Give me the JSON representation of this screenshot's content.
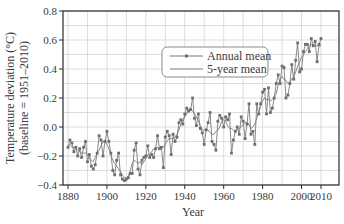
{
  "chart_data": {
    "type": "line",
    "title": "",
    "xlabel": "Year",
    "ylabel": "Temperature deviation (°C)",
    "ylabel_sub": "(baseline = 1951–2010)",
    "xlim": [
      1877,
      2019
    ],
    "ylim": [
      -0.4,
      0.8
    ],
    "grid": true,
    "legend_position": "upper center-right",
    "x_ticks": [
      1880,
      1900,
      1920,
      1940,
      1960,
      1980,
      2000,
      2010
    ],
    "y_ticks": [
      -0.4,
      -0.2,
      0.0,
      0.2,
      0.4,
      0.6,
      0.8
    ],
    "y_tick_labels": [
      "−0.4",
      "−0.2",
      "0.0",
      "0.2",
      "0.4",
      "0.6",
      "0.8"
    ],
    "x": [
      1880,
      1881,
      1882,
      1883,
      1884,
      1885,
      1886,
      1887,
      1888,
      1889,
      1890,
      1891,
      1892,
      1893,
      1894,
      1895,
      1896,
      1897,
      1898,
      1899,
      1900,
      1901,
      1902,
      1903,
      1904,
      1905,
      1906,
      1907,
      1908,
      1909,
      1910,
      1911,
      1912,
      1913,
      1914,
      1915,
      1916,
      1917,
      1918,
      1919,
      1920,
      1921,
      1922,
      1923,
      1924,
      1925,
      1926,
      1927,
      1928,
      1929,
      1930,
      1931,
      1932,
      1933,
      1934,
      1935,
      1936,
      1937,
      1938,
      1939,
      1940,
      1941,
      1942,
      1943,
      1944,
      1945,
      1946,
      1947,
      1948,
      1949,
      1950,
      1951,
      1952,
      1953,
      1954,
      1955,
      1956,
      1957,
      1958,
      1959,
      1960,
      1961,
      1962,
      1963,
      1964,
      1965,
      1966,
      1967,
      1968,
      1969,
      1970,
      1971,
      1972,
      1973,
      1974,
      1975,
      1976,
      1977,
      1978,
      1979,
      1980,
      1981,
      1982,
      1983,
      1984,
      1985,
      1986,
      1987,
      1988,
      1989,
      1990,
      1991,
      1992,
      1993,
      1994,
      1995,
      1996,
      1997,
      1998,
      1999,
      2000,
      2001,
      2002,
      2003,
      2004,
      2005,
      2006,
      2007,
      2008,
      2009,
      2010
    ],
    "series": [
      {
        "name": "Annual mean",
        "marker": "square",
        "values": [
          -0.14,
          -0.09,
          -0.11,
          -0.17,
          -0.14,
          -0.2,
          -0.15,
          -0.21,
          -0.14,
          -0.1,
          -0.24,
          -0.19,
          -0.27,
          -0.29,
          -0.26,
          -0.18,
          -0.06,
          -0.09,
          -0.2,
          -0.1,
          -0.03,
          -0.1,
          -0.18,
          -0.3,
          -0.33,
          -0.23,
          -0.18,
          -0.33,
          -0.36,
          -0.37,
          -0.36,
          -0.35,
          -0.32,
          -0.32,
          -0.16,
          -0.11,
          -0.29,
          -0.33,
          -0.23,
          -0.21,
          -0.2,
          -0.13,
          -0.21,
          -0.19,
          -0.21,
          -0.15,
          -0.06,
          -0.15,
          -0.14,
          -0.28,
          -0.07,
          -0.03,
          -0.06,
          -0.19,
          -0.05,
          -0.1,
          -0.07,
          0.03,
          0.05,
          0.02,
          0.09,
          0.13,
          0.11,
          0.12,
          0.2,
          0.06,
          0.01,
          0.09,
          -0.01,
          -0.04,
          -0.12,
          -0.02,
          0.03,
          0.1,
          -0.1,
          -0.12,
          -0.16,
          0.04,
          0.08,
          0.06,
          0.0,
          0.07,
          0.05,
          0.09,
          -0.18,
          -0.09,
          -0.03,
          0.0,
          -0.05,
          0.07,
          0.04,
          -0.08,
          0.02,
          0.16,
          -0.05,
          -0.03,
          -0.12,
          0.16,
          0.09,
          0.16,
          0.24,
          0.26,
          0.09,
          0.27,
          0.1,
          0.13,
          0.2,
          0.3,
          0.36,
          0.3,
          0.42,
          0.41,
          0.2,
          0.22,
          0.3,
          0.43,
          0.33,
          0.46,
          0.58,
          0.38,
          0.4,
          0.52,
          0.57,
          0.57,
          0.52,
          0.61,
          0.56,
          0.59,
          0.45,
          0.57,
          0.61
        ]
      },
      {
        "name": "5-year mean",
        "marker": "none",
        "values": [
          -0.13,
          -0.12,
          -0.14,
          -0.14,
          -0.15,
          -0.16,
          -0.17,
          -0.18,
          -0.18,
          -0.18,
          -0.19,
          -0.21,
          -0.23,
          -0.24,
          -0.21,
          -0.18,
          -0.16,
          -0.13,
          -0.1,
          -0.1,
          -0.12,
          -0.15,
          -0.19,
          -0.23,
          -0.25,
          -0.27,
          -0.29,
          -0.31,
          -0.33,
          -0.35,
          -0.35,
          -0.34,
          -0.3,
          -0.25,
          -0.23,
          -0.24,
          -0.25,
          -0.24,
          -0.26,
          -0.24,
          -0.22,
          -0.19,
          -0.19,
          -0.17,
          -0.15,
          -0.15,
          -0.14,
          -0.15,
          -0.14,
          -0.14,
          -0.12,
          -0.09,
          -0.08,
          -0.08,
          -0.08,
          -0.07,
          -0.05,
          -0.02,
          0.02,
          0.05,
          0.07,
          0.09,
          0.12,
          0.13,
          0.11,
          0.09,
          0.07,
          0.04,
          0.01,
          -0.02,
          -0.02,
          -0.02,
          -0.02,
          -0.04,
          -0.05,
          -0.05,
          -0.03,
          -0.02,
          0.0,
          0.04,
          0.05,
          0.04,
          0.01,
          -0.01,
          -0.01,
          -0.02,
          -0.03,
          -0.02,
          -0.01,
          0.0,
          0.02,
          0.03,
          0.03,
          0.02,
          -0.01,
          0.0,
          0.02,
          0.06,
          0.1,
          0.15,
          0.18,
          0.2,
          0.19,
          0.19,
          0.18,
          0.19,
          0.21,
          0.23,
          0.29,
          0.33,
          0.35,
          0.33,
          0.32,
          0.3,
          0.31,
          0.33,
          0.35,
          0.38,
          0.42,
          0.45,
          0.48,
          0.5,
          0.52,
          0.54,
          0.56,
          0.57,
          0.56,
          0.56,
          0.56,
          0.56,
          0.56
        ]
      }
    ]
  },
  "axes": {
    "xlabel": "Year",
    "ylabel_line1": "Temperature deviation (°C)",
    "ylabel_line2": "(baseline = 1951–2010)"
  },
  "legend": {
    "items": [
      {
        "label": "Annual mean"
      },
      {
        "label": "5-year mean"
      }
    ]
  },
  "colors": {
    "line": "#7a7a7a",
    "marker": "#6e6e6e",
    "grid": "#d4d4d4",
    "frame": "#2a2a2a",
    "text": "#3a3a3a"
  }
}
